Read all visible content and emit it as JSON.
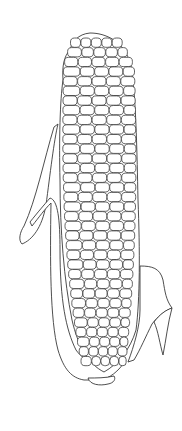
{
  "image": {
    "subject": "corn-cob-line-drawing",
    "background_color": "#ffffff",
    "line_color": "#3a3a3a",
    "description": "Outline drawing of an ear of corn with kernels and husk leaves"
  },
  "cob": {
    "top": [
      90,
      33
    ],
    "bottom": [
      102,
      372
    ],
    "left_edge_x": 60,
    "right_edge_x": 138,
    "kernel_columns": 5,
    "kernel_rows": 34
  },
  "husks": {
    "left_outer_tip": [
      20,
      235
    ],
    "left_inner_tip": [
      50,
      196
    ],
    "right_lobe_point": [
      172,
      308
    ],
    "right_tip": [
      163,
      355
    ]
  }
}
